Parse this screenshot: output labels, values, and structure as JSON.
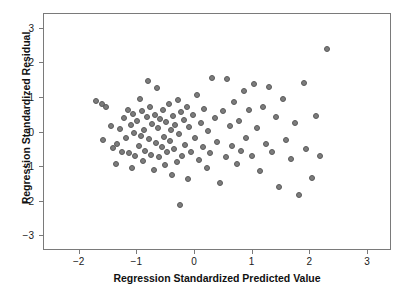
{
  "chart_data": {
    "type": "scatter",
    "title": "Scatterplot",
    "xlabel": "Regression Standardized Predicted Value",
    "ylabel": "Regression Standardized Residual",
    "xlim": [
      -2.6,
      3.4
    ],
    "ylim": [
      -3.4,
      3.4
    ],
    "xticks": [
      -2,
      -1,
      0,
      1,
      2,
      3
    ],
    "xticklabels": [
      "-2",
      "-1",
      "0",
      "1",
      "2",
      "3"
    ],
    "yticks": [
      3,
      2,
      1,
      0,
      -1,
      -2,
      -3
    ],
    "yticklabels": [
      "3",
      "2",
      "1",
      "0",
      "-1",
      "-2",
      "-3"
    ],
    "grid": false,
    "legend": null,
    "marker": {
      "shape": "circle",
      "fill_color": "#7c7c7c",
      "edge_color": "#5a5a5a",
      "size_px": 6
    },
    "n_points": 112,
    "points": [
      [
        -1.7,
        0.88
      ],
      [
        -1.6,
        0.8
      ],
      [
        -1.52,
        0.72
      ],
      [
        -1.58,
        -0.25
      ],
      [
        -1.44,
        0.15
      ],
      [
        -1.4,
        -0.48
      ],
      [
        -1.36,
        -0.95
      ],
      [
        -1.33,
        -0.35
      ],
      [
        -1.28,
        0.08
      ],
      [
        -1.24,
        -0.58
      ],
      [
        -1.22,
        0.38
      ],
      [
        -1.18,
        -0.18
      ],
      [
        -1.15,
        0.62
      ],
      [
        -1.12,
        -0.62
      ],
      [
        -1.1,
        0.18
      ],
      [
        -1.08,
        -1.05
      ],
      [
        -1.06,
        0.5
      ],
      [
        -1.04,
        -0.05
      ],
      [
        -1.02,
        -0.72
      ],
      [
        -0.98,
        0.3
      ],
      [
        -0.96,
        -0.42
      ],
      [
        -0.94,
        0.95
      ],
      [
        -0.92,
        -0.12
      ],
      [
        -0.9,
        0.58
      ],
      [
        -0.88,
        -0.85
      ],
      [
        -0.86,
        0.05
      ],
      [
        -0.84,
        -0.55
      ],
      [
        -0.82,
        0.42
      ],
      [
        -0.8,
        1.45
      ],
      [
        -0.78,
        -0.22
      ],
      [
        -0.76,
        0.7
      ],
      [
        -0.74,
        -0.68
      ],
      [
        -0.72,
        0.22
      ],
      [
        -0.7,
        -1.12
      ],
      [
        -0.68,
        0.48
      ],
      [
        -0.66,
        -0.32
      ],
      [
        -0.64,
        1.25
      ],
      [
        -0.62,
        0.1
      ],
      [
        -0.6,
        -0.75
      ],
      [
        -0.58,
        0.35
      ],
      [
        -0.56,
        -0.45
      ],
      [
        -0.54,
        0.62
      ],
      [
        -0.52,
        -0.15
      ],
      [
        -0.5,
        -0.98
      ],
      [
        -0.48,
        0.28
      ],
      [
        -0.46,
        -0.6
      ],
      [
        -0.44,
        0.8
      ],
      [
        -0.42,
        -0.28
      ],
      [
        -0.4,
        0.05
      ],
      [
        -0.38,
        -1.25
      ],
      [
        -0.36,
        0.45
      ],
      [
        -0.34,
        -0.52
      ],
      [
        -0.32,
        0.18
      ],
      [
        -0.3,
        -0.88
      ],
      [
        -0.28,
        0.92
      ],
      [
        -0.26,
        -0.08
      ],
      [
        -0.24,
        -2.12
      ],
      [
        -0.22,
        0.55
      ],
      [
        -0.2,
        -0.7
      ],
      [
        -0.18,
        0.32
      ],
      [
        -0.15,
        -0.38
      ],
      [
        -0.12,
        0.72
      ],
      [
        -0.1,
        -1.38
      ],
      [
        -0.08,
        0.12
      ],
      [
        -0.05,
        -0.58
      ],
      [
        -0.02,
        0.48
      ],
      [
        0.02,
        -0.2
      ],
      [
        0.05,
        1.05
      ],
      [
        0.08,
        -0.82
      ],
      [
        0.12,
        0.25
      ],
      [
        0.15,
        -0.45
      ],
      [
        0.18,
        0.65
      ],
      [
        0.22,
        -1.05
      ],
      [
        0.25,
        0.02
      ],
      [
        0.28,
        -0.62
      ],
      [
        0.32,
        1.55
      ],
      [
        0.36,
        0.38
      ],
      [
        0.4,
        -0.3
      ],
      [
        0.45,
        -1.48
      ],
      [
        0.5,
        0.58
      ],
      [
        0.55,
        -0.75
      ],
      [
        0.58,
        1.52
      ],
      [
        0.62,
        0.15
      ],
      [
        0.66,
        -0.42
      ],
      [
        0.7,
        0.85
      ],
      [
        0.74,
        -0.95
      ],
      [
        0.78,
        0.3
      ],
      [
        0.82,
        -0.55
      ],
      [
        0.86,
        1.18
      ],
      [
        0.9,
        -0.18
      ],
      [
        0.95,
        0.62
      ],
      [
        1.0,
        -0.7
      ],
      [
        1.05,
        1.38
      ],
      [
        1.1,
        0.1
      ],
      [
        1.15,
        -1.15
      ],
      [
        1.2,
        0.72
      ],
      [
        1.25,
        -0.35
      ],
      [
        1.3,
        1.28
      ],
      [
        1.35,
        -0.6
      ],
      [
        1.42,
        0.42
      ],
      [
        1.48,
        -1.62
      ],
      [
        1.55,
        0.95
      ],
      [
        1.6,
        -0.25
      ],
      [
        1.68,
        -0.8
      ],
      [
        1.75,
        0.25
      ],
      [
        1.82,
        -1.85
      ],
      [
        1.9,
        1.4
      ],
      [
        1.95,
        -0.52
      ],
      [
        2.05,
        -1.35
      ],
      [
        2.12,
        0.45
      ],
      [
        2.18,
        -0.72
      ],
      [
        2.3,
        2.4
      ]
    ]
  }
}
